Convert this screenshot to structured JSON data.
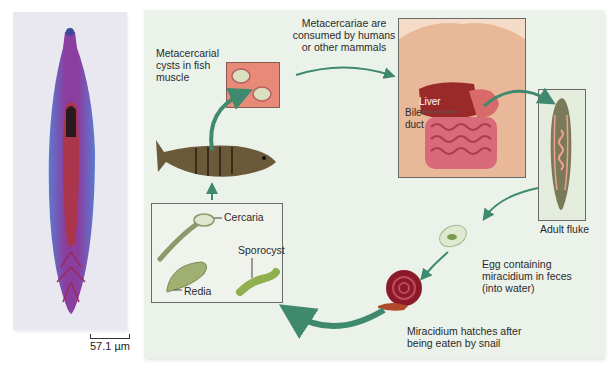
{
  "micrograph": {
    "scale_bar_label": "57.1 µm"
  },
  "life_cycle": {
    "stages": [
      {
        "id": "metacercarial-cysts",
        "label": "Metacercarial cysts in fish muscle"
      },
      {
        "id": "consumption",
        "label": "Metacercariae are consumed by humans or other mammals"
      },
      {
        "id": "adult",
        "label": "Adult fluke"
      },
      {
        "id": "egg",
        "label": "Egg containing miracidium in feces (into water)"
      },
      {
        "id": "snail",
        "label": "Miracidium hatches after being eaten by snail"
      }
    ],
    "labels": {
      "cysts_line1": "Metacercarial",
      "cysts_line2": "cysts in fish",
      "cysts_line3": "muscle",
      "consume_line1": "Metacercariae are",
      "consume_line2": "consumed by humans",
      "consume_line3": "or other mammals",
      "liver": "Liver",
      "bile_line1": "Bile",
      "bile_line2": "duct",
      "adult": "Adult fluke",
      "egg_line1": "Egg containing",
      "egg_line2": "miracidium in feces",
      "egg_line3": "(into water)",
      "snail_line1": "Miracidium hatches after",
      "snail_line2": "being eaten by snail",
      "cercaria": "Cercaria",
      "sporocyst": "Sporocyst",
      "redia": "Redia"
    }
  },
  "colors": {
    "arrow": "#3f8a6e",
    "panel_bg": "#eaf2ea",
    "fluke_stain": "#7b3fa0"
  }
}
